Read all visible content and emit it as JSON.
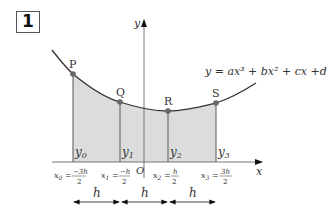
{
  "figure": {
    "number": "1",
    "equation": "y = ax³ + bx² + cx +d",
    "axes": {
      "x_label": "x",
      "y_label": "y",
      "origin_label": "O"
    },
    "points": [
      {
        "label": "P",
        "x": 73,
        "y": 74
      },
      {
        "label": "Q",
        "x": 120,
        "y": 102
      },
      {
        "label": "R",
        "x": 168,
        "y": 111
      },
      {
        "label": "S",
        "x": 216,
        "y": 103
      }
    ],
    "ordinates": [
      {
        "label": "y",
        "sub": "0"
      },
      {
        "label": "y",
        "sub": "1"
      },
      {
        "label": "y",
        "sub": "2"
      },
      {
        "label": "y",
        "sub": "3"
      }
    ],
    "x_values": [
      {
        "name": "x",
        "sub": "0",
        "num": "−3h",
        "den": "2"
      },
      {
        "name": "x",
        "sub": "1",
        "num": "−h",
        "den": "2"
      },
      {
        "name": "x",
        "sub": "2",
        "num": "h",
        "den": "2"
      },
      {
        "name": "x",
        "sub": "3",
        "num": "3h",
        "den": "2"
      }
    ],
    "interval_label": "h",
    "colors": {
      "shade": "#dcdcdc",
      "line": "#333333",
      "point": "#666666"
    }
  }
}
